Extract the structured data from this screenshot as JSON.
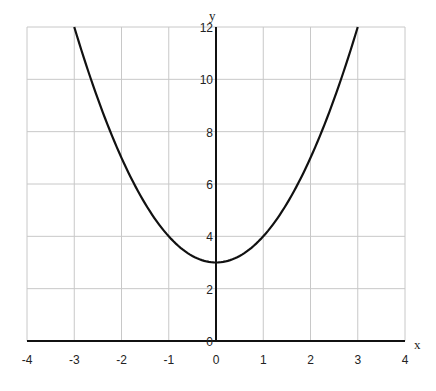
{
  "chart_data": {
    "type": "line",
    "title": "",
    "function": "y = x^2 + 3",
    "xlabel": "x",
    "ylabel": "y",
    "xlim": [
      -4,
      4
    ],
    "ylim": [
      0,
      12
    ],
    "grid": true,
    "legend": null,
    "x_ticks": [
      "-4",
      "-3",
      "-2",
      "-1",
      "0",
      "1",
      "2",
      "3",
      "4"
    ],
    "y_ticks": [
      "0",
      "2",
      "4",
      "6",
      "8",
      "10",
      "12"
    ],
    "series": [
      {
        "name": "y = x^2 + 3",
        "x": [
          -3,
          -2.5,
          -2,
          -1.5,
          -1,
          -0.5,
          0,
          0.5,
          1,
          1.5,
          2,
          2.5,
          3
        ],
        "y": [
          12,
          9.25,
          7,
          5.25,
          4,
          3.25,
          3,
          3.25,
          4,
          5.25,
          7,
          9.25,
          12
        ]
      }
    ],
    "colors": {
      "curve": "#111111",
      "axes": "#111111",
      "grid": "#c8c8c8"
    }
  }
}
